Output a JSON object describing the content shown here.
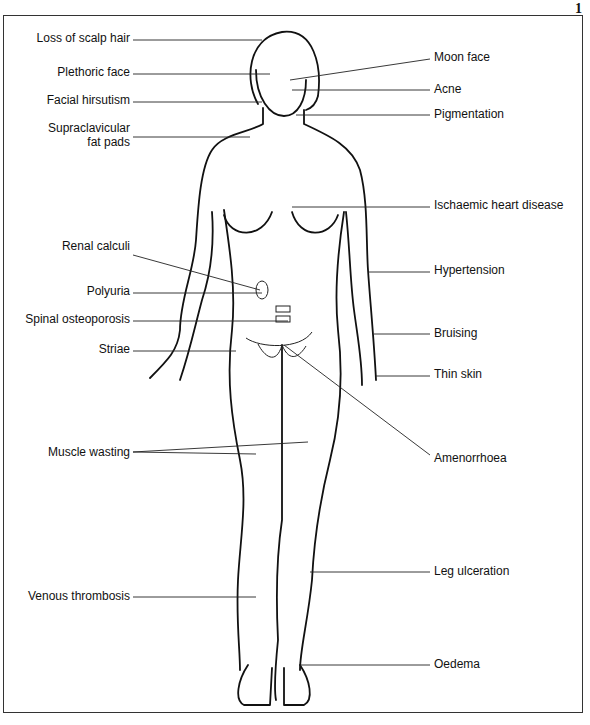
{
  "figure_number": "1",
  "labels_left": [
    {
      "id": "loss-of-scalp-hair",
      "text": "Loss of scalp hair"
    },
    {
      "id": "plethoric-face",
      "text": "Plethoric face"
    },
    {
      "id": "facial-hirsutism",
      "text": "Facial hirsutism"
    },
    {
      "id": "supraclavicular-fat-pads",
      "text": "Supraclavicular"
    },
    {
      "id": "supraclavicular-fat-pads-2",
      "text": "fat pads"
    },
    {
      "id": "renal-calculi",
      "text": "Renal calculi"
    },
    {
      "id": "polyuria",
      "text": "Polyuria"
    },
    {
      "id": "spinal-osteoporosis",
      "text": "Spinal osteoporosis"
    },
    {
      "id": "striae",
      "text": "Striae"
    },
    {
      "id": "muscle-wasting",
      "text": "Muscle wasting"
    },
    {
      "id": "venous-thrombosis",
      "text": "Venous thrombosis"
    }
  ],
  "labels_right": [
    {
      "id": "moon-face",
      "text": "Moon face"
    },
    {
      "id": "acne",
      "text": "Acne"
    },
    {
      "id": "pigmentation",
      "text": "Pigmentation"
    },
    {
      "id": "ischaemic-heart-disease",
      "text": "Ischaemic heart disease"
    },
    {
      "id": "hypertension",
      "text": "Hypertension"
    },
    {
      "id": "bruising",
      "text": "Bruising"
    },
    {
      "id": "thin-skin",
      "text": "Thin skin"
    },
    {
      "id": "amenorrhoea",
      "text": "Amenorrhoea"
    },
    {
      "id": "leg-ulceration",
      "text": "Leg ulceration"
    },
    {
      "id": "oedema",
      "text": "Oedema"
    }
  ]
}
